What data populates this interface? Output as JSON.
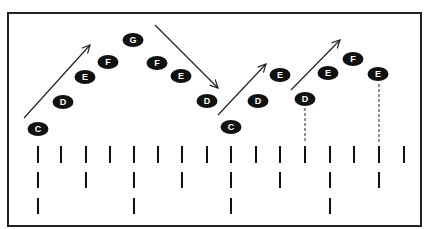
{
  "frame": {
    "x": 8,
    "y": 13,
    "width": 413,
    "height": 213,
    "stroke": "#222222"
  },
  "colors": {
    "note_fill": "#111111",
    "note_text": "#ffffff",
    "line": "#222222",
    "background": "#ffffff"
  },
  "notes": [
    {
      "label": "C",
      "x": 38,
      "y": 129
    },
    {
      "label": "D",
      "x": 63,
      "y": 102
    },
    {
      "label": "E",
      "x": 85,
      "y": 77
    },
    {
      "label": "F",
      "x": 108,
      "y": 62
    },
    {
      "label": "G",
      "x": 133,
      "y": 40
    },
    {
      "label": "F",
      "x": 157,
      "y": 63
    },
    {
      "label": "E",
      "x": 181,
      "y": 76
    },
    {
      "label": "D",
      "x": 207,
      "y": 101
    },
    {
      "label": "C",
      "x": 231,
      "y": 127
    },
    {
      "label": "D",
      "x": 258,
      "y": 101
    },
    {
      "label": "E",
      "x": 280,
      "y": 75
    },
    {
      "label": "D",
      "x": 305,
      "y": 99
    },
    {
      "label": "E",
      "x": 328,
      "y": 73
    },
    {
      "label": "F",
      "x": 353,
      "y": 59
    },
    {
      "label": "E",
      "x": 378,
      "y": 74
    }
  ],
  "arrows": [
    {
      "name": "ascending-arrow-1",
      "x1": 24,
      "y1": 118,
      "x2": 90,
      "y2": 45
    },
    {
      "name": "descending-arrow-1",
      "x1": 155,
      "y1": 25,
      "x2": 218,
      "y2": 88
    },
    {
      "name": "ascending-arrow-2",
      "x1": 218,
      "y1": 115,
      "x2": 266,
      "y2": 64
    },
    {
      "name": "ascending-arrow-3",
      "x1": 291,
      "y1": 90,
      "x2": 340,
      "y2": 40
    }
  ],
  "dashed_lines": [
    {
      "x": 305,
      "y1": 108,
      "y2": 143
    },
    {
      "x": 379,
      "y1": 84,
      "y2": 143
    }
  ],
  "beat_rows": [
    {
      "name": "row-1",
      "y1": 146,
      "y2": 163,
      "xs": [
        38,
        61,
        86,
        110,
        134,
        158,
        182,
        207,
        231,
        256,
        280,
        305,
        330,
        354,
        379,
        404
      ]
    },
    {
      "name": "row-2",
      "y1": 172,
      "y2": 188,
      "xs": [
        38,
        86,
        134,
        182,
        231,
        280,
        330,
        379
      ]
    },
    {
      "name": "row-3",
      "y1": 198,
      "y2": 214,
      "xs": [
        38,
        134,
        231,
        330
      ]
    }
  ]
}
